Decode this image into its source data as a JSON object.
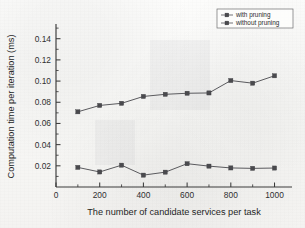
{
  "chart_data": {
    "type": "line",
    "title": "",
    "xlabel": "The number of candidate services per task",
    "ylabel": "Computation time per iteration (ms)",
    "x": [
      100,
      200,
      300,
      400,
      500,
      600,
      700,
      800,
      900,
      1000
    ],
    "xlim": [
      0,
      1080
    ],
    "ylim": [
      0,
      0.152
    ],
    "xticks": [
      0,
      200,
      400,
      600,
      800,
      1000
    ],
    "xticklabels": [
      "0",
      "200",
      "400",
      "600",
      "800",
      "1000"
    ],
    "xminor_step": 100,
    "yticks": [
      0.02,
      0.04,
      0.06,
      0.08,
      0.1,
      0.12,
      0.14
    ],
    "yticklabels": [
      "0.02",
      "0.04",
      "0.06",
      "0.08",
      "0.10",
      "0.12",
      "0.14"
    ],
    "yorigin_label": "0",
    "grid": false,
    "legend_position": "top-right",
    "marker": "filled-square",
    "series": [
      {
        "name": "with pruning",
        "color": "#4a4a4e",
        "values": [
          0.0185,
          0.0142,
          0.0206,
          0.0112,
          0.014,
          0.022,
          0.0197,
          0.018,
          0.0176,
          0.0179
        ]
      },
      {
        "name": "without pruning",
        "color": "#4a4a4e",
        "values": [
          0.071,
          0.077,
          0.079,
          0.0855,
          0.0875,
          0.0885,
          0.0888,
          0.1005,
          0.098,
          0.105
        ]
      }
    ]
  },
  "legend": {
    "entries": [
      {
        "label": "with pruning"
      },
      {
        "label": "without pruning"
      }
    ]
  }
}
